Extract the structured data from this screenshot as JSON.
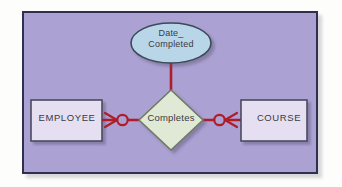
{
  "diagram": {
    "type": "entity-relationship-diagram",
    "notation": "crows-foot",
    "background_color": "#aba1d3",
    "frame_border_color": "#2f3050",
    "connector_color": "#b01c28",
    "entities": [
      {
        "id": "employee",
        "label": "EMPLOYEE",
        "shape": "rectangle",
        "fill_color": "#e5dff1",
        "border_color": "#4a4a5e"
      },
      {
        "id": "course",
        "label": "COURSE",
        "shape": "rectangle",
        "fill_color": "#e5dff1",
        "border_color": "#4a4a5e"
      }
    ],
    "relationship": {
      "id": "completes",
      "label": "Completes",
      "shape": "diamond",
      "fill_color": "#dfe9d5",
      "border_color": "#6e7a63"
    },
    "attribute": {
      "id": "date-completed",
      "label_line_1": "Date_",
      "label_line_2": "Completed",
      "shape": "ellipse",
      "fill_color": "#b9d6e9",
      "border_color": "#3c4a58"
    },
    "connectors": [
      {
        "id": "employee-to-completes",
        "from": "employee",
        "to": "completes",
        "cardinality_symbol": "crows-foot-optional",
        "meaning": "zero-or-many"
      },
      {
        "id": "completes-to-course",
        "from": "completes",
        "to": "course",
        "cardinality_symbol": "crows-foot-optional",
        "meaning": "zero-or-many"
      },
      {
        "id": "completes-to-date-completed",
        "from": "completes",
        "to": "date-completed",
        "cardinality_symbol": "plain-line",
        "meaning": "attribute-link"
      }
    ]
  }
}
